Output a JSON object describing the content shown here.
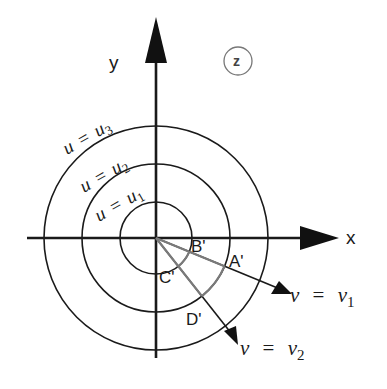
{
  "diagram": {
    "plane_label": "z",
    "axes": {
      "x_label": "x",
      "y_label": "y"
    },
    "circles": [
      {
        "id": "u1",
        "label_var": "u",
        "label_eq": "=",
        "label_val": "u",
        "label_sub": "1"
      },
      {
        "id": "u2",
        "label_var": "u",
        "label_eq": "=",
        "label_val": "u",
        "label_sub": "2"
      },
      {
        "id": "u3",
        "label_var": "u",
        "label_eq": "=",
        "label_val": "u",
        "label_sub": "3"
      }
    ],
    "rays": [
      {
        "id": "v1",
        "label_var": "v",
        "label_eq": "=",
        "label_val": "v",
        "label_sub": "1"
      },
      {
        "id": "v2",
        "label_var": "v",
        "label_eq": "=",
        "label_val": "v",
        "label_sub": "2"
      }
    ],
    "points": {
      "A": "A'",
      "B": "B'",
      "C": "C'",
      "D": "D'"
    },
    "colors": {
      "ink": "#1a1a1a",
      "highlight": "#7a7a7a",
      "background": "#ffffff"
    }
  }
}
